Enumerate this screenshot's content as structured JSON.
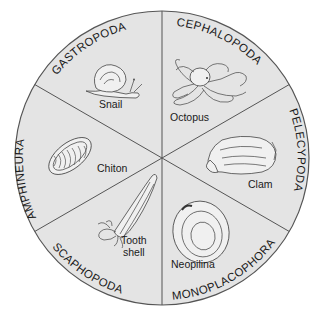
{
  "diagram": {
    "type": "circle-divided-into-sectors",
    "colors": {
      "disk_fill": "#e4e4e4",
      "outline": "#555555",
      "text": "#1a1a1a",
      "background": "#ffffff"
    },
    "sectors": [
      {
        "id": "gastropoda",
        "class_name": "GASTROPODA",
        "animal": "Snail",
        "position": "top-left"
      },
      {
        "id": "cephalopoda",
        "class_name": "CEPHALOPODA",
        "animal": "Octopus",
        "position": "top-right"
      },
      {
        "id": "pelecypoda",
        "class_name": "PELECYPODA",
        "animal": "Clam",
        "position": "right"
      },
      {
        "id": "monoplacophora",
        "class_name": "MONOPLACOPHORA",
        "animal": "Neopilina",
        "position": "bottom-right"
      },
      {
        "id": "scaphopoda",
        "class_name": "SCAPHOPODA",
        "animal_line1": "Tooth",
        "animal_line2": "shell",
        "position": "bottom-left"
      },
      {
        "id": "amphineura",
        "class_name": "AMPHINEURA",
        "animal": "Chiton",
        "position": "left"
      }
    ]
  }
}
